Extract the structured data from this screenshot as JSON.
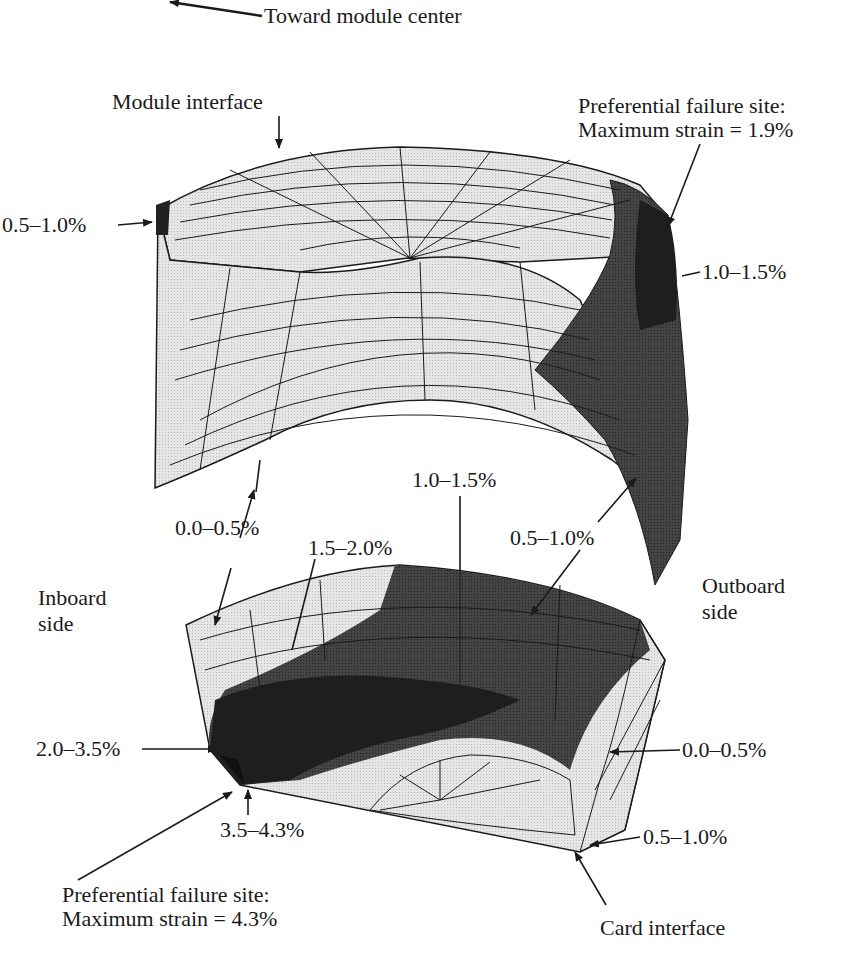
{
  "figure": {
    "top_label": "Toward module center",
    "upper_part": {
      "interface_label": "Module interface",
      "failure_site_line1": "Preferential failure site:",
      "failure_site_line2": "Maximum strain = 1.9%",
      "ranges": {
        "left_edge": "0.5–1.0%",
        "right_edge": "1.0–1.5%",
        "inner_face": "0.0–0.5%",
        "outer_face": "0.5–1.0%"
      }
    },
    "lower_part": {
      "interface_label": "Card interface",
      "failure_site_line1": "Preferential failure site:",
      "failure_site_line2": "Maximum strain = 4.3%",
      "ranges": {
        "top_band": "1.0–1.5%",
        "mid_band": "1.5–2.0%",
        "left_corner": "2.0–3.5%",
        "corner_max": "3.5–4.3%",
        "right_face": "0.0–0.5%",
        "right_corner": "0.5–1.0%"
      }
    },
    "side_labels": {
      "inboard_line1": "Inboard",
      "inboard_line2": "side",
      "outboard_line1": "Outboard",
      "outboard_line2": "side"
    },
    "colors": {
      "light_fill": "#e4e4e4",
      "mid_fill": "#4a4a4a",
      "dark_fill": "#1e1e1e",
      "mesh_line": "#1a1a1a"
    }
  }
}
